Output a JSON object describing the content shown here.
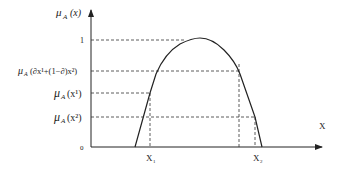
{
  "diagram": {
    "title": "",
    "y_axis_label_mu": "μ",
    "y_axis_label_sub": "A",
    "y_axis_label_arg": "(x)",
    "x_axis_label": "X",
    "y_ticks": [
      {
        "mu": "μ",
        "sub": "A",
        "arg": "",
        "text": "1",
        "kind": "plain"
      },
      {
        "mu": "μ",
        "sub": "A",
        "arg": "(∂x¹+(1−∂)x²)",
        "kind": "mu"
      },
      {
        "mu": "μ",
        "sub": "A",
        "arg": "(x¹)",
        "kind": "mu"
      },
      {
        "mu": "μ",
        "sub": "A",
        "arg": "(x²)",
        "kind": "mu"
      },
      {
        "text": "0",
        "kind": "plain"
      }
    ],
    "x_ticks": [
      {
        "main": "X",
        "sub": "1"
      },
      {
        "main": "X",
        "sub": "2"
      }
    ],
    "curve_description": "Concave membership function μ_A(x) rising from 0 to peak 1 and falling back to 0; dashed guides show μ_A(∂x¹+(1−∂)x²) ≥ min(μ_A(x¹), μ_A(x²))"
  }
}
